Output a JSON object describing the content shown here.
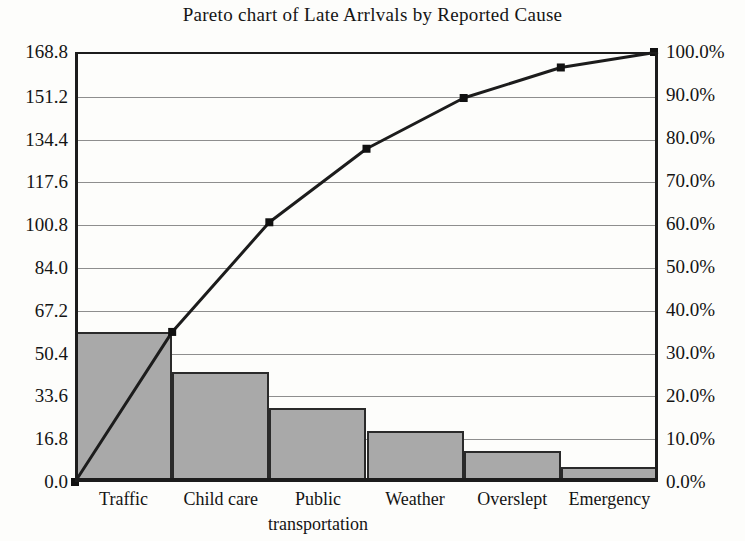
{
  "chart_data": {
    "type": "bar",
    "title": "Pareto chart of Late Arrlvals by Reported Cause",
    "subtitle": "",
    "xlabel": "",
    "ylabel": "",
    "categories": [
      "Traffic",
      "Child care",
      "Public transportation",
      "Weather",
      "Overslept",
      "Emergency"
    ],
    "category_lines": [
      [
        "Traffic"
      ],
      [
        "Child care"
      ],
      [
        "Public",
        "transportation"
      ],
      [
        "Weather"
      ],
      [
        "Overslept"
      ],
      [
        "Emergency"
      ]
    ],
    "series": [
      {
        "name": "Count",
        "type": "bar",
        "axis": "left",
        "values": [
          59,
          43,
          29,
          20,
          12,
          6
        ]
      },
      {
        "name": "Cumulative percentage",
        "type": "line",
        "axis": "right",
        "values": [
          34.9,
          60.4,
          77.5,
          89.3,
          96.4,
          100.0
        ],
        "cumulative_counts": [
          59,
          102,
          131,
          151,
          163,
          169
        ]
      }
    ],
    "total": 169,
    "ylim": [
      0.0,
      168.8
    ],
    "ylim_right": [
      0.0,
      100.0
    ],
    "ytick_step": 16.8,
    "ytick_step_right": 10.0,
    "grid": true,
    "legend": "none",
    "y_ticks": [
      "0.0",
      "16.8",
      "33.6",
      "50.4",
      "67.2",
      "84.0",
      "100.8",
      "117.6",
      "134.4",
      "151.2",
      "168.8"
    ],
    "y_ticks_values": [
      0.0,
      16.8,
      33.6,
      50.4,
      67.2,
      84.0,
      100.8,
      117.6,
      134.4,
      151.2,
      168.8
    ],
    "y_ticks_right": [
      "0.0%",
      "10.0%",
      "20.0%",
      "30.0%",
      "40.0%",
      "50.0%",
      "60.0%",
      "70.0%",
      "80.0%",
      "90.0%",
      "100.0%"
    ],
    "y_ticks_right_values": [
      0,
      10,
      20,
      30,
      40,
      50,
      60,
      70,
      80,
      90,
      100
    ],
    "colors": {
      "bar_fill": "#a9a9a9",
      "bar_border": "#2a2a2a",
      "line": "#1c1c1c",
      "marker": "#111111",
      "grid": "#8e8e8e",
      "axis": "#1c1c1c",
      "background": "#fdfdfb",
      "text": "#141414"
    }
  }
}
